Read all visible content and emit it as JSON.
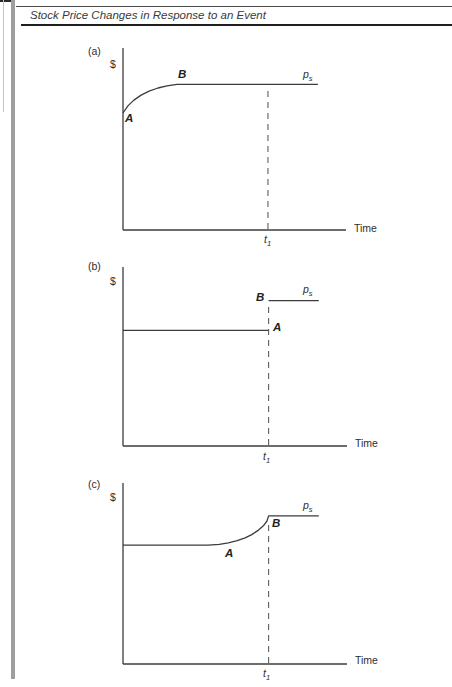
{
  "header": {
    "title": "Stock Price Changes in Response to an Event"
  },
  "panels": [
    {
      "tag": "(a)",
      "y_axis": "$",
      "x_axis": "Time",
      "point_a": "A",
      "point_b": "B",
      "p_base": "p",
      "p_sub": "s",
      "t_base": "t",
      "t_sub": "1"
    },
    {
      "tag": "(b)",
      "y_axis": "$",
      "x_axis": "Time",
      "point_a": "A",
      "point_b": "B",
      "p_base": "p",
      "p_sub": "s",
      "t_base": "t",
      "t_sub": "1"
    },
    {
      "tag": "(c)",
      "y_axis": "$",
      "x_axis": "Time",
      "point_a": "A",
      "point_b": "B",
      "p_base": "p",
      "p_sub": "s",
      "t_base": "t",
      "t_sub": "1"
    }
  ],
  "chart_data": [
    {
      "type": "line",
      "panel": "a",
      "title": "Price adjusts gradually in advance; fully adjusted at B well before the event date t1",
      "xlabel": "Time",
      "ylabel": "$",
      "x_range": [
        0,
        1
      ],
      "y_range": [
        0,
        1
      ],
      "t1_x": 0.65,
      "ps_level": 0.8,
      "points": {
        "A": [
          0.0,
          0.643
        ],
        "B": [
          0.242,
          0.8
        ]
      },
      "annotations": [
        "A",
        "B",
        "p_s",
        "t_1"
      ],
      "grid": false,
      "series": [
        {
          "name": "stock-price",
          "points": [
            [
              0,
              0.643
            ],
            [
              0.022,
              0.682
            ],
            [
              0.049,
              0.714
            ],
            [
              0.081,
              0.741
            ],
            [
              0.117,
              0.763
            ],
            [
              0.157,
              0.78
            ],
            [
              0.197,
              0.792
            ],
            [
              0.242,
              0.8
            ],
            [
              0.874,
              0.8
            ]
          ]
        }
      ]
    },
    {
      "type": "line",
      "panel": "b",
      "title": "Price constant until the event at t1, then jumps instantly from A up to B at level p_s",
      "xlabel": "Time",
      "ylabel": "$",
      "x_range": [
        0,
        1
      ],
      "y_range": [
        0,
        1
      ],
      "t1_x": 0.65,
      "ps_level": 0.812,
      "points": {
        "A": [
          0.65,
          0.646
        ],
        "B": [
          0.65,
          0.812
        ]
      },
      "annotations": [
        "A",
        "B",
        "p_s",
        "t_1"
      ],
      "grid": false,
      "series": [
        {
          "name": "stock-price-pre-event",
          "points": [
            [
              0,
              0.646
            ],
            [
              0.65,
              0.646
            ]
          ]
        },
        {
          "name": "stock-price-post-event",
          "points": [
            [
              0.65,
              0.812
            ],
            [
              0.874,
              0.812
            ]
          ]
        }
      ]
    },
    {
      "type": "line",
      "panel": "c",
      "title": "Price flat, then begins rising at A before the event and completes its adjustment to p_s at t1 (point B)",
      "xlabel": "Time",
      "ylabel": "$",
      "x_range": [
        0,
        1
      ],
      "y_range": [
        0,
        1
      ],
      "t1_x": 0.65,
      "ps_level": 0.818,
      "points": {
        "A": [
          0.46,
          0.66
        ],
        "B": [
          0.65,
          0.818
        ]
      },
      "annotations": [
        "A",
        "B",
        "p_s",
        "t_1"
      ],
      "grid": false,
      "series": [
        {
          "name": "stock-price",
          "points": [
            [
              0,
              0.657
            ],
            [
              0.38,
              0.657
            ],
            [
              0.43,
              0.661
            ],
            [
              0.47,
              0.669
            ],
            [
              0.51,
              0.681
            ],
            [
              0.545,
              0.697
            ],
            [
              0.575,
              0.715
            ],
            [
              0.605,
              0.74
            ],
            [
              0.628,
              0.766
            ],
            [
              0.643,
              0.79
            ],
            [
              0.65,
              0.818
            ],
            [
              0.874,
              0.818
            ]
          ]
        }
      ]
    }
  ]
}
